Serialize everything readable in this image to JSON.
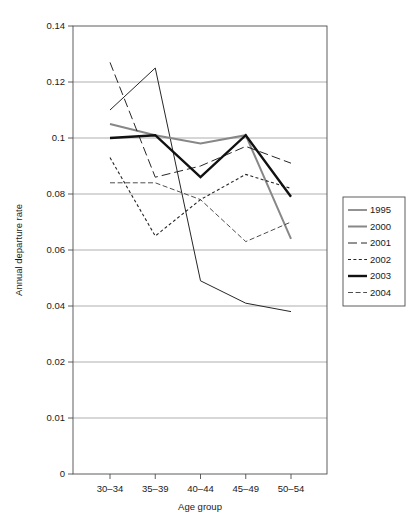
{
  "chart_data": {
    "type": "line",
    "title": "",
    "xlabel": "Age group",
    "ylabel": "Annual departure rate",
    "categories": [
      "30–34",
      "35–39",
      "40–44",
      "45–49",
      "50–54"
    ],
    "ytick_labels": [
      "0.14",
      "0.12",
      "0.1",
      "0.08",
      "0.06",
      "0.04",
      "0.02",
      "0.01",
      "0"
    ],
    "ytick_values": [
      0.14,
      0.12,
      0.1,
      0.08,
      0.06,
      0.04,
      0.02,
      0.01,
      0
    ],
    "ylim": [
      0,
      0.14
    ],
    "grid": "horizontal",
    "legend_position": "right",
    "series": [
      {
        "name": "1995",
        "values": [
          0.11,
          0.125,
          0.049,
          0.041,
          0.038
        ],
        "color": "#262626",
        "width": 1.0,
        "dash": "none"
      },
      {
        "name": "2000",
        "values": [
          0.105,
          0.101,
          0.098,
          0.101,
          0.064
        ],
        "color": "#878787",
        "width": 2.0,
        "dash": "none"
      },
      {
        "name": "2001",
        "values": [
          0.127,
          0.086,
          0.09,
          0.097,
          0.091
        ],
        "color": "#262626",
        "width": 1.0,
        "dash": "9,4"
      },
      {
        "name": "2002",
        "values": [
          0.093,
          0.065,
          0.078,
          0.087,
          0.082
        ],
        "color": "#262626",
        "width": 1.1,
        "dash": "3,2.4"
      },
      {
        "name": "2003",
        "values": [
          0.1,
          0.101,
          0.086,
          0.101,
          0.079
        ],
        "color": "#111111",
        "width": 2.4,
        "dash": "none"
      },
      {
        "name": "2004",
        "values": [
          0.084,
          0.084,
          0.078,
          0.063,
          0.07
        ],
        "color": "#3a3a3a",
        "width": 0.9,
        "dash": "5,2.6"
      }
    ]
  }
}
